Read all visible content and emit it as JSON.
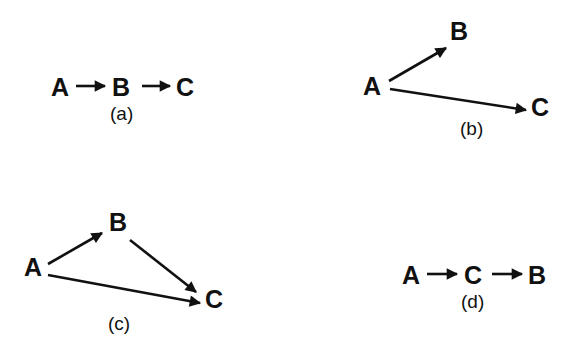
{
  "figure": {
    "panels": [
      {
        "id": "a",
        "caption": "(a)",
        "nodes": [
          {
            "id": "A",
            "label": "A"
          },
          {
            "id": "B",
            "label": "B"
          },
          {
            "id": "C",
            "label": "C"
          }
        ],
        "edges": [
          {
            "from": "A",
            "to": "B"
          },
          {
            "from": "B",
            "to": "C"
          }
        ]
      },
      {
        "id": "b",
        "caption": "(b)",
        "nodes": [
          {
            "id": "A",
            "label": "A"
          },
          {
            "id": "B",
            "label": "B"
          },
          {
            "id": "C",
            "label": "C"
          }
        ],
        "edges": [
          {
            "from": "A",
            "to": "B"
          },
          {
            "from": "A",
            "to": "C"
          }
        ]
      },
      {
        "id": "c",
        "caption": "(c)",
        "nodes": [
          {
            "id": "A",
            "label": "A"
          },
          {
            "id": "B",
            "label": "B"
          },
          {
            "id": "C",
            "label": "C"
          }
        ],
        "edges": [
          {
            "from": "A",
            "to": "B"
          },
          {
            "from": "B",
            "to": "C"
          },
          {
            "from": "A",
            "to": "C"
          }
        ]
      },
      {
        "id": "d",
        "caption": "(d)",
        "nodes": [
          {
            "id": "A",
            "label": "A"
          },
          {
            "id": "C",
            "label": "C"
          },
          {
            "id": "B",
            "label": "B"
          }
        ],
        "edges": [
          {
            "from": "A",
            "to": "C"
          },
          {
            "from": "C",
            "to": "B"
          }
        ]
      }
    ]
  },
  "colors": {
    "ink": "#111111",
    "background": "#ffffff"
  }
}
